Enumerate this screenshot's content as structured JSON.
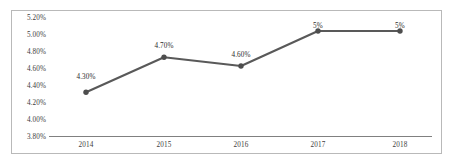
{
  "chart_data": {
    "type": "line",
    "title": "",
    "subtitle": "",
    "xlabel": "",
    "ylabel": "",
    "categories": [
      "2014",
      "2015",
      "2016",
      "2017",
      "2018"
    ],
    "values": [
      4.3,
      4.7,
      4.6,
      5.0,
      5.0
    ],
    "point_labels": [
      "4.30%",
      "4.70%",
      "4.60%",
      "5%",
      "5%"
    ],
    "ylim": [
      3.8,
      5.2
    ],
    "ytick_values": [
      5.2,
      5.0,
      4.8,
      4.6,
      4.4,
      4.2,
      4.0,
      3.8
    ],
    "ytick_labels": [
      "5.20%",
      "5.00%",
      "4.80%",
      "4.60%",
      "4.40%",
      "4.20%",
      "4.00%",
      "3.80%"
    ],
    "grid": false,
    "legend": false,
    "legend_position": "none",
    "series": [
      {
        "name": "",
        "values": [
          4.3,
          4.7,
          4.6,
          5.0,
          5.0
        ],
        "color": "#595959",
        "marker": "circle"
      }
    ],
    "colors": {
      "line": "#595959",
      "marker": "#4d4d4d",
      "axis": "#808080",
      "frame": "#b9b9b9",
      "text": "#3c3c3c",
      "background": "#ffffff"
    }
  }
}
